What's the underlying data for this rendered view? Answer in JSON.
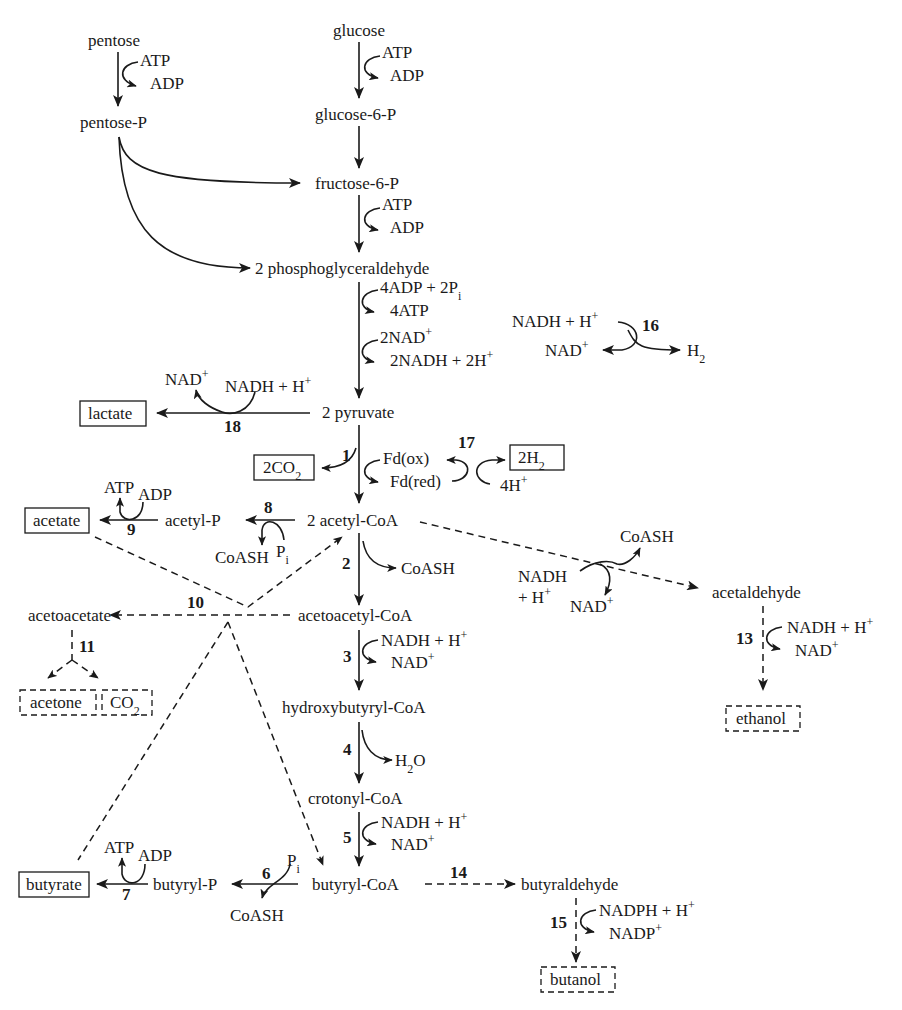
{
  "diagram": {
    "type": "metabolic-pathway",
    "compounds": {
      "pentose": "pentose",
      "pentose_p": "pentose-P",
      "glucose": "glucose",
      "glucose_6p": "glucose-6-P",
      "fructose_6p": "fructose-6-P",
      "pgald": "2 phosphoglyceraldehyde",
      "pyruvate": "2 pyruvate",
      "lactate": "lactate",
      "acetyl_coa": "2 acetyl-CoA",
      "acetyl_p": "acetyl-P",
      "acetate": "acetate",
      "acetoacetyl_coa": "acetoacetyl-CoA",
      "acetoacetate": "acetoacetate",
      "acetone": "acetone",
      "hydroxybutyryl_coa": "hydroxybutyryl-CoA",
      "crotonyl_coa": "crotonyl-CoA",
      "butyryl_coa": "butyryl-CoA",
      "butyryl_p": "butyryl-P",
      "butyrate": "butyrate",
      "butyraldehyde": "butyraldehyde",
      "butanol": "butanol",
      "acetaldehyde": "acetaldehyde",
      "ethanol": "ethanol"
    },
    "cofactors": {
      "atp": "ATP",
      "adp": "ADP",
      "adp4_pi": "4ADP + 2P",
      "pi_sub": "i",
      "atp4": "4ATP",
      "nad2": "2NAD",
      "nadh2": "2NADH + 2H",
      "nadh_h": "NADH + H",
      "nadh": "NADH",
      "plus_h": "+ H",
      "nad": "NAD",
      "nadph_h": "NADPH + H",
      "nadp": "NADP",
      "h2": "H",
      "two": "2",
      "plus": "+",
      "co2_box": "2CO",
      "co2": "CO",
      "h2_box": "2H",
      "h4": "4H",
      "fd_ox": "Fd(ox)",
      "fd_red": "Fd(red)",
      "coash": "CoASH",
      "p": "P",
      "h2o_h": "H",
      "h2o_o": "O"
    },
    "reactions": [
      "1",
      "2",
      "3",
      "4",
      "5",
      "6",
      "7",
      "8",
      "9",
      "10",
      "11",
      "13",
      "14",
      "15",
      "16",
      "17",
      "18"
    ],
    "legend": {
      "solid_arrow": "enzymatic step",
      "dashed_arrow": "solventogenic step",
      "boxed": "end product"
    }
  }
}
